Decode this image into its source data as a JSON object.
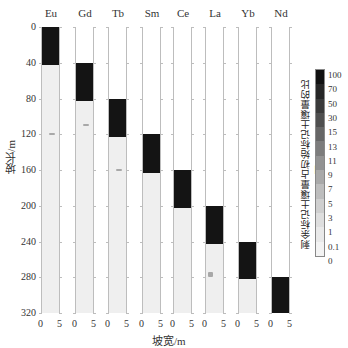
{
  "chart_data": {
    "type": "heatmap",
    "title": "",
    "xlabel": "坡宽/m",
    "ylabel": "坡长/m",
    "y_ticks": [
      0,
      40,
      80,
      120,
      160,
      200,
      240,
      280,
      320
    ],
    "ylim": [
      0,
      320
    ],
    "x_ticks_per_panel": [
      0,
      5
    ],
    "panels": [
      {
        "element": "Eu",
        "marked_from_m": 0,
        "marked_to_m": 43,
        "residual_spot_m": 120
      },
      {
        "element": "Gd",
        "marked_from_m": 40,
        "marked_to_m": 83,
        "residual_spot_m": 110
      },
      {
        "element": "Tb",
        "marked_from_m": 80,
        "marked_to_m": 123,
        "residual_spot_m": 160
      },
      {
        "element": "Sm",
        "marked_from_m": 120,
        "marked_to_m": 163,
        "residual_spot_m": null
      },
      {
        "element": "Ce",
        "marked_from_m": 160,
        "marked_to_m": 203,
        "residual_spot_m": null
      },
      {
        "element": "La",
        "marked_from_m": 200,
        "marked_to_m": 243,
        "residual_spot_m": 275
      },
      {
        "element": "Yb",
        "marked_from_m": 240,
        "marked_to_m": 282,
        "residual_spot_m": null
      },
      {
        "element": "Nd",
        "marked_from_m": 280,
        "marked_to_m": 320,
        "residual_spot_m": null
      }
    ],
    "colorbar": {
      "title": "剩余标记土壤量占初始标记土壤量的比例/%",
      "levels": [
        "100",
        "70",
        "50",
        "30",
        "15",
        "13",
        "11",
        "9",
        "7",
        "5",
        "3",
        "1",
        "0.1",
        "0"
      ],
      "colors": [
        "#111111",
        "#262626",
        "#3a3a3a",
        "#4f4f4f",
        "#666666",
        "#7c7c7c",
        "#929292",
        "#a9a9a9",
        "#bdbdbd",
        "#cfcfcf",
        "#dedede",
        "#e9e9e9",
        "#f3f3f3"
      ]
    }
  },
  "labels": {
    "xlabel": "坡宽/m",
    "ylabel": "坡长/m",
    "y_ticks": [
      "0",
      "40",
      "80",
      "120",
      "160",
      "200",
      "240",
      "280",
      "320"
    ],
    "x0": "0",
    "x5": "5",
    "panel_titles": [
      "Eu",
      "Gd",
      "Tb",
      "Sm",
      "Ce",
      "La",
      "Yb",
      "Nd"
    ],
    "cbar_title": "剩余标记土壤量占初始标记土壤量的比例/%",
    "cbar_levels": [
      "100",
      "70",
      "50",
      "30",
      "15",
      "13",
      "11",
      "9",
      "7",
      "5",
      "3",
      "1",
      "0.1",
      "0"
    ]
  }
}
